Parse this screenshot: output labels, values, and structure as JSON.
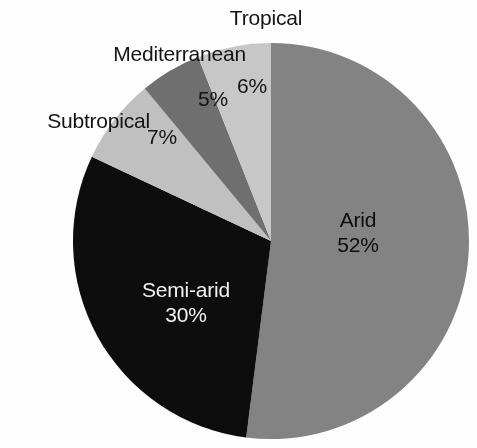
{
  "chart_data": {
    "type": "pie",
    "title": "",
    "subtitle": "",
    "xlabel": "",
    "ylabel": "",
    "legend_position": "none",
    "grid": false,
    "units": "percent",
    "total": 100,
    "start_angle_deg": 90,
    "direction": "counterclockwise",
    "categories": [
      "Tropical",
      "Mediterranean",
      "Subtropical",
      "Semi-arid",
      "Arid"
    ],
    "values": [
      6,
      5,
      7,
      30,
      52
    ],
    "value_labels": [
      "6%",
      "5%",
      "7%",
      "30%",
      "52%"
    ],
    "slices": [
      {
        "name": "Tropical",
        "value": 6,
        "value_label": "6%",
        "color": "#c9c9c9",
        "label_placement": "outside",
        "value_placement": "inside",
        "value_text_color": "#141414"
      },
      {
        "name": "Mediterranean",
        "value": 5,
        "value_label": "5%",
        "color": "#6f6f6f",
        "label_placement": "outside",
        "value_placement": "inside",
        "value_text_color": "#141414"
      },
      {
        "name": "Subtropical",
        "value": 7,
        "value_label": "7%",
        "color": "#c2c2c2",
        "label_placement": "outside",
        "value_placement": "inside",
        "value_text_color": "#141414"
      },
      {
        "name": "Semi-arid",
        "value": 30,
        "value_label": "30%",
        "color": "#090909",
        "label_placement": "inside",
        "value_placement": "inside",
        "value_text_color": "#f2f2f2"
      },
      {
        "name": "Arid",
        "value": 52,
        "value_label": "52%",
        "color": "#848484",
        "label_placement": "inside",
        "value_placement": "inside",
        "value_text_color": "#0d0d0d"
      }
    ]
  },
  "labels": {
    "tropical": "Tropical",
    "mediterranean": "Mediterranean",
    "subtropical": "Subtropical",
    "arid_name": "Arid",
    "semiarid_name": "Semi-arid"
  },
  "percentages": {
    "tropical": "6%",
    "mediterranean": "5%",
    "subtropical": "7%",
    "arid": "52%",
    "semiarid": "30%"
  },
  "colors": {
    "background": "#ffffff",
    "arid": "#848484",
    "semiarid": "#090909",
    "subtropical": "#c2c2c2",
    "mediterranean": "#6f6f6f",
    "tropical": "#c9c9c9",
    "text_dark": "#141414",
    "text_light": "#f2f2f2"
  },
  "geometry": {
    "center_x": 271,
    "center_y": 241,
    "radius": 198
  }
}
